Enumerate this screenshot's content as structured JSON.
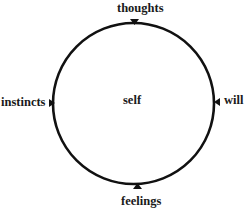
{
  "diagram": {
    "center_label": "self",
    "nodes": [
      {
        "id": "thoughts",
        "label": "thoughts",
        "position": "top",
        "arrow_direction": "down"
      },
      {
        "id": "will",
        "label": "will",
        "position": "right",
        "arrow_direction": "left"
      },
      {
        "id": "feelings",
        "label": "feelings",
        "position": "bottom",
        "arrow_direction": "up"
      },
      {
        "id": "instincts",
        "label": "instincts",
        "position": "left",
        "arrow_direction": "right"
      }
    ],
    "shape": "circle",
    "colors": {
      "stroke": "#111111",
      "text": "#1a1a1a",
      "background": "#ffffff"
    }
  }
}
